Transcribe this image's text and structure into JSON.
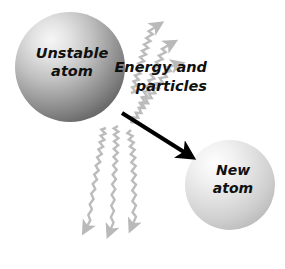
{
  "figure": {
    "background_color": "#ffffff",
    "caption_partial": "",
    "atoms": [
      {
        "id": "unstable-atom",
        "label_line1": "Unstable",
        "label_line2": "atom",
        "cx": 70,
        "cy": 67,
        "r": 55,
        "highlight_color": "#f2f2f2",
        "mid_color": "#b4b4b4",
        "edge_color": "#6e6e6e"
      },
      {
        "id": "new-atom",
        "label_line1": "New",
        "label_line2": "atom",
        "cx": 230,
        "cy": 185,
        "r": 45,
        "highlight_color": "#fcfcfc",
        "mid_color": "#dcdcdc",
        "edge_color": "#b0b0b0"
      }
    ],
    "callout": {
      "id": "energy-and-particles",
      "line1": "Energy and",
      "line2": "particles",
      "x": 205,
      "y1": 71,
      "y2": 90,
      "font_size": 14
    },
    "decay_arrow": {
      "id": "decay-arrow",
      "color": "#000000",
      "x1": 122,
      "y1": 113,
      "x2": 188,
      "y2": 155,
      "width": 4
    },
    "wavy_arrows": {
      "color": "#b9b9b9",
      "stroke_width": 2.4,
      "count": 6,
      "emission_label": "energy and particles emitted"
    }
  }
}
